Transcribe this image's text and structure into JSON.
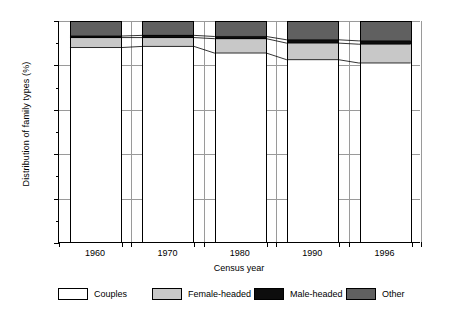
{
  "chart_data": {
    "type": "bar",
    "stacked": true,
    "title": "",
    "xlabel": "Census year",
    "ylabel": "Distribution of family types (%)",
    "categories": [
      "1960",
      "1970",
      "1980",
      "1990",
      "1996"
    ],
    "ylim": [
      0,
      100
    ],
    "yticks": [
      0,
      20,
      40,
      60,
      80,
      100
    ],
    "ytick_labels": [
      "0",
      "20",
      "40",
      "60",
      "80",
      "100"
    ],
    "yminor_ticks": [
      10,
      30,
      50,
      70,
      90
    ],
    "grid": "both",
    "legend_position": "bottom",
    "series": [
      {
        "name": "Couples",
        "color": "#ffffff",
        "values": [
          88.0,
          88.5,
          85.5,
          82.5,
          81.0
        ]
      },
      {
        "name": "Female-headed",
        "color": "#c8c8c8",
        "values": [
          4.5,
          4.0,
          6.5,
          7.5,
          8.5
        ]
      },
      {
        "name": "Male-headed",
        "color": "#0d0d0d",
        "values": [
          0.7,
          1.0,
          1.0,
          1.5,
          1.5
        ]
      },
      {
        "name": "Other",
        "color": "#606060",
        "values": [
          6.8,
          6.5,
          7.0,
          8.5,
          9.0
        ]
      }
    ]
  },
  "axes": {
    "y_title": "Distribution of family types (%)",
    "x_title": "Census year",
    "y_tick_labels": [
      "100",
      "80",
      "60",
      "40",
      "20",
      "0"
    ],
    "x_tick_labels": [
      "1960",
      "1970",
      "1980",
      "1990",
      "1996"
    ]
  },
  "legend": {
    "items": [
      {
        "label": "Couples",
        "swatch": "white-swatch",
        "color": "#ffffff"
      },
      {
        "label": "Female-headed",
        "swatch": "light-gray-swatch",
        "color": "#c8c8c8"
      },
      {
        "label": "Male-headed",
        "swatch": "black-swatch",
        "color": "#0d0d0d"
      },
      {
        "label": "Other",
        "swatch": "dark-gray-swatch",
        "color": "#606060"
      }
    ]
  }
}
